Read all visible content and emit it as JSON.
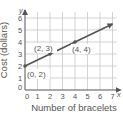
{
  "chart_data": {
    "type": "line",
    "title": "",
    "xlabel": "Number of bracelets",
    "ylabel": "Cost (dollars)",
    "x_axis_letter": "x",
    "y_axis_letter": "y",
    "xlim": [
      0,
      7
    ],
    "ylim": [
      0,
      6
    ],
    "x_ticks": [
      "0",
      "1",
      "2",
      "3",
      "4",
      "5",
      "6",
      "7"
    ],
    "y_ticks": [
      "0",
      "1",
      "2",
      "3",
      "4",
      "5",
      "6"
    ],
    "grid": true,
    "legend": null,
    "series": [
      {
        "name": "cost",
        "x": [
          0,
          7
        ],
        "y": [
          2,
          5.5
        ],
        "arrow_end": true
      }
    ],
    "points": [
      {
        "x": 0,
        "y": 2,
        "label": "(0, 2)"
      },
      {
        "x": 2,
        "y": 3,
        "label": "(2, 3)"
      },
      {
        "x": 4,
        "y": 4,
        "label": "(4, 4)"
      }
    ],
    "colors": {
      "grid": "#c8c8c8",
      "axis": "#555555",
      "line": "#555555",
      "text": "#555555"
    }
  }
}
